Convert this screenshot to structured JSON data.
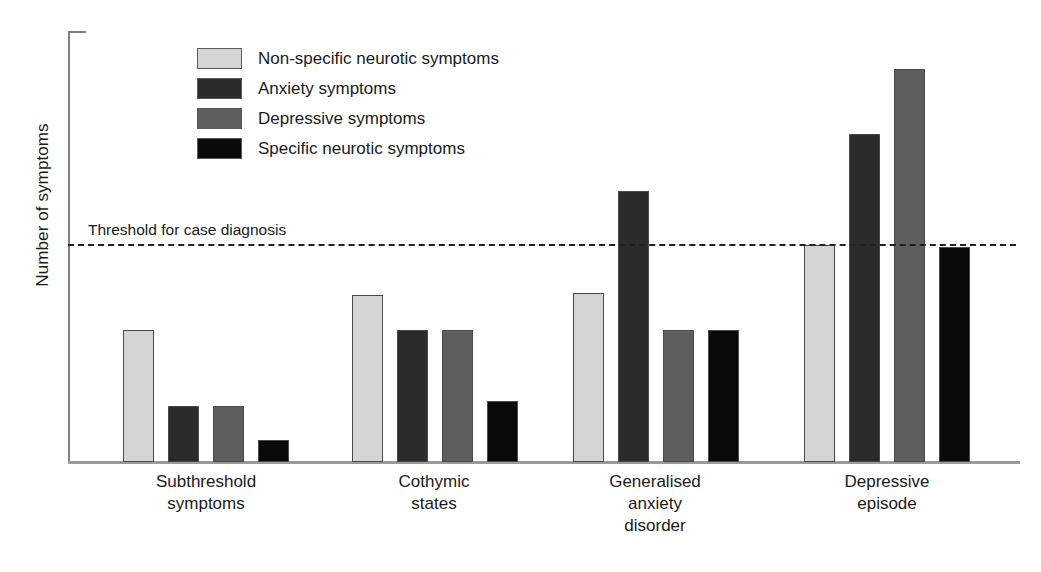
{
  "chart_data": {
    "type": "bar",
    "title": "",
    "xlabel": "",
    "ylabel": "Number of symptoms",
    "ylim": [
      0,
      10
    ],
    "grid": false,
    "legend_position": "top-left",
    "categories": [
      "Subthreshold\nsymptoms",
      "Cothymic\nstates",
      "Generalised\nanxiety\ndisorder",
      "Depressive\nepisode"
    ],
    "series": [
      {
        "name": "Non-specific neurotic symptoms",
        "color": "#d5d5d5",
        "values": [
          3.05,
          3.85,
          3.9,
          5.0
        ]
      },
      {
        "name": "Anxiety symptoms",
        "color": "#2b2b2b",
        "values": [
          1.3,
          3.05,
          6.25,
          7.55
        ]
      },
      {
        "name": "Depressive symptoms",
        "color": "#5e5e5e",
        "values": [
          1.3,
          3.05,
          3.05,
          9.05
        ]
      },
      {
        "name": "Specific neurotic symptoms",
        "color": "#0a0a0a",
        "values": [
          0.5,
          1.4,
          3.05,
          4.95
        ]
      }
    ],
    "annotations": [
      {
        "name": "threshold",
        "label": "Threshold for case diagnosis",
        "value": 5.0,
        "style": "dashed",
        "color": "#222222"
      }
    ]
  },
  "legend": {
    "items": [
      {
        "label": "Non-specific neurotic symptoms",
        "color": "#d5d5d5"
      },
      {
        "label": "Anxiety symptoms",
        "color": "#2b2b2b"
      },
      {
        "label": "Depressive symptoms",
        "color": "#5e5e5e"
      },
      {
        "label": "Specific neurotic symptoms",
        "color": "#0a0a0a"
      }
    ]
  },
  "axes": {
    "y_title": "Number of symptoms"
  },
  "layout": {
    "baseline_y": 462,
    "axis_left_x": 68,
    "axis_right_x": 1020,
    "threshold_y": 245,
    "value_per_pixel_reference": {
      "value": 5.0,
      "pixels": 217
    },
    "bar_width": 31,
    "group_starts": [
      123,
      352,
      573,
      804
    ],
    "bar_pitch": 45,
    "caption_tops": [
      471,
      471,
      471,
      471
    ],
    "caption_centers": [
      206,
      434,
      655,
      887
    ]
  }
}
